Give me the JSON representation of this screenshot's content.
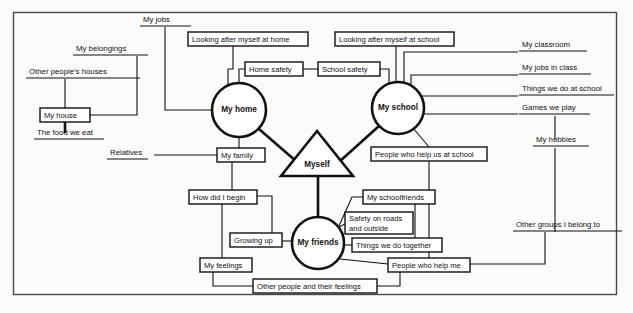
{
  "diagram": {
    "type": "concept-map",
    "frame": {
      "x": 13,
      "y": 12,
      "width": 604,
      "height": 283
    },
    "center": {
      "id": "myself",
      "label": "Myself",
      "shape": "triangle",
      "x": 317,
      "y": 155
    },
    "hubs": [
      {
        "id": "my-home",
        "label": "My home",
        "shape": "circle",
        "cx": 239,
        "cy": 110,
        "r": 27
      },
      {
        "id": "my-school",
        "label": "My school",
        "shape": "circle",
        "cx": 398,
        "cy": 108,
        "r": 26
      },
      {
        "id": "my-friends",
        "label": "My friends",
        "shape": "circle",
        "cx": 318,
        "cy": 243,
        "r": 26
      }
    ],
    "boxes": [
      {
        "id": "looking-after-myself-at-home",
        "label": "Looking after myself at home",
        "x": 188,
        "y": 32,
        "w": 120,
        "h": 14
      },
      {
        "id": "home-safety",
        "label": "Home safety",
        "x": 245,
        "y": 62,
        "w": 58,
        "h": 14
      },
      {
        "id": "school-safety",
        "label": "School safety",
        "x": 318,
        "y": 62,
        "w": 62,
        "h": 14
      },
      {
        "id": "looking-after-myself-at-school",
        "label": "Looking after myself at school",
        "x": 335,
        "y": 32,
        "w": 119,
        "h": 14
      },
      {
        "id": "my-house",
        "label": "My house",
        "x": 40,
        "y": 108,
        "w": 50,
        "h": 14
      },
      {
        "id": "my-family",
        "label": "My family",
        "x": 217,
        "y": 148,
        "w": 48,
        "h": 14
      },
      {
        "id": "people-who-help-us-at-school",
        "label": "People who help us at school",
        "x": 371,
        "y": 147,
        "w": 116,
        "h": 14
      },
      {
        "id": "how-did-i-begin",
        "label": "How did I begin",
        "x": 189,
        "y": 190,
        "w": 68,
        "h": 14
      },
      {
        "id": "my-schoolfriends",
        "label": "My schoolfriends",
        "x": 363,
        "y": 190,
        "w": 72,
        "h": 14
      },
      {
        "id": "safety-on-roads-and-outside",
        "label": "Safety on roads",
        "label2": "and outside",
        "x": 345,
        "y": 212,
        "w": 68,
        "h": 22
      },
      {
        "id": "growing-up",
        "label": "Growing up",
        "x": 230,
        "y": 233,
        "w": 52,
        "h": 14
      },
      {
        "id": "things-we-do-together",
        "label": "Things we do together",
        "x": 352,
        "y": 238,
        "w": 90,
        "h": 14
      },
      {
        "id": "my-feelings",
        "label": "My feelings",
        "x": 200,
        "y": 258,
        "w": 52,
        "h": 14
      },
      {
        "id": "people-who-help-me",
        "label": "People who help me",
        "x": 388,
        "y": 258,
        "w": 82,
        "h": 14
      },
      {
        "id": "other-people-and-their-feelings",
        "label": "Other people and their feelings",
        "x": 253,
        "y": 279,
        "w": 124,
        "h": 14
      }
    ],
    "underlined_labels": [
      {
        "id": "my-jobs",
        "label": "My jobs",
        "x": 143,
        "y": 20,
        "w": 44
      },
      {
        "id": "my-belongings",
        "label": "My belongings",
        "x": 76,
        "y": 49,
        "w": 64
      },
      {
        "id": "my-classroom",
        "label": "My classroom",
        "x": 522,
        "y": 45,
        "w": 62
      },
      {
        "id": "other-peoples-houses",
        "label": "Other people's houses",
        "x": 29,
        "y": 72,
        "w": 104
      },
      {
        "id": "my-jobs-in-class",
        "label": "My jobs in class",
        "x": 522,
        "y": 68,
        "w": 66
      },
      {
        "id": "things-we-do-at-school",
        "label": "Things we do at school",
        "x": 522,
        "y": 89,
        "w": 92
      },
      {
        "id": "games-we-play",
        "label": "Games we play",
        "x": 522,
        "y": 108,
        "w": 66
      },
      {
        "id": "the-food-we-eat",
        "label": "The food we eat",
        "x": 37,
        "y": 133,
        "w": 66
      },
      {
        "id": "my-hobbies",
        "label": "My hobbies",
        "x": 536,
        "y": 140,
        "w": 52
      },
      {
        "id": "relatives",
        "label": "Relatives",
        "x": 110,
        "y": 153,
        "w": 44
      },
      {
        "id": "other-groups-i-belong-to",
        "label": "Other groups I belong to",
        "x": 516,
        "y": 225,
        "w": 104
      }
    ],
    "edges": [
      {
        "from": "my-jobs",
        "to": "my-home",
        "style": "thin"
      },
      {
        "from": "my-belongings",
        "to": "my-house",
        "style": "thin"
      },
      {
        "from": "other-peoples-houses",
        "to": "my-house",
        "style": "thin"
      },
      {
        "from": "my-house",
        "to": "the-food-we-eat",
        "style": "thin"
      },
      {
        "from": "looking-after-myself-at-home",
        "to": "my-home",
        "style": "thin"
      },
      {
        "from": "home-safety",
        "to": "my-home",
        "style": "thin"
      },
      {
        "from": "home-safety",
        "to": "school-safety",
        "style": "thin"
      },
      {
        "from": "school-safety",
        "to": "my-school",
        "style": "thin"
      },
      {
        "from": "looking-after-myself-at-school",
        "to": "my-school",
        "style": "thin"
      },
      {
        "from": "my-school",
        "to": "my-classroom",
        "style": "thin"
      },
      {
        "from": "my-school",
        "to": "my-jobs-in-class",
        "style": "thin"
      },
      {
        "from": "my-school",
        "to": "things-we-do-at-school",
        "style": "thin"
      },
      {
        "from": "my-school",
        "to": "games-we-play",
        "style": "thin"
      },
      {
        "from": "games-we-play",
        "to": "my-hobbies",
        "style": "thin"
      },
      {
        "from": "my-hobbies",
        "to": "other-groups-i-belong-to",
        "style": "thin"
      },
      {
        "from": "my-home",
        "to": "my-family",
        "style": "thin"
      },
      {
        "from": "relatives",
        "to": "my-family",
        "style": "thin"
      },
      {
        "from": "my-family",
        "to": "how-did-i-begin",
        "style": "thin"
      },
      {
        "from": "my-home",
        "to": "myself",
        "style": "thick"
      },
      {
        "from": "my-school",
        "to": "myself",
        "style": "thick"
      },
      {
        "from": "myself",
        "to": "my-friends",
        "style": "thick"
      },
      {
        "from": "my-school",
        "to": "people-who-help-us-at-school",
        "style": "thin"
      },
      {
        "from": "people-who-help-us-at-school",
        "to": "people-who-help-me",
        "style": "thin"
      },
      {
        "from": "how-did-i-begin",
        "to": "growing-up",
        "style": "thin"
      },
      {
        "from": "how-did-i-begin",
        "to": "my-feelings",
        "style": "thin"
      },
      {
        "from": "growing-up",
        "to": "my-friends",
        "style": "thin"
      },
      {
        "from": "my-friends",
        "to": "safety-on-roads-and-outside",
        "style": "thin"
      },
      {
        "from": "my-friends",
        "to": "things-we-do-together",
        "style": "thin"
      },
      {
        "from": "my-friends",
        "to": "my-schoolfriends",
        "style": "thin"
      },
      {
        "from": "my-friends",
        "to": "people-who-help-me",
        "style": "thin"
      },
      {
        "from": "my-schoolfriends",
        "to": "things-we-do-together",
        "style": "thin"
      },
      {
        "from": "my-feelings",
        "to": "other-people-and-their-feelings",
        "style": "thin"
      },
      {
        "from": "other-people-and-their-feelings",
        "to": "people-who-help-me",
        "style": "thin"
      },
      {
        "from": "people-who-help-me",
        "to": "other-groups-i-belong-to",
        "style": "thin"
      }
    ],
    "colors": {
      "ink": "#111111",
      "paper": "#fbfbf9",
      "frame": "#4a4a4a"
    }
  }
}
